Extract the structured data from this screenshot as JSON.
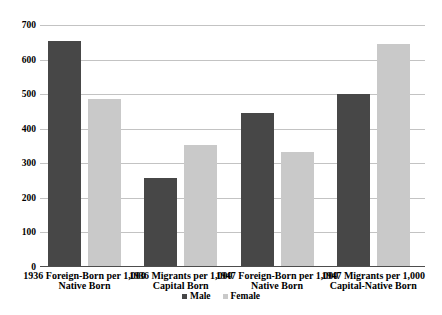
{
  "chart_data": {
    "type": "bar",
    "title": "",
    "xlabel": "",
    "ylabel": "",
    "categories": [
      "1936 Foreign-Born per 1,000\nNative Born",
      "1936 Migrants per 1,000\nCapital Born",
      "1947 Foreign-Born per 1,000\nNative Born",
      "1947 Migrants per 1,000\nCapital-Native Born"
    ],
    "series": [
      {
        "name": "Male",
        "color": "#474747",
        "values": [
          655,
          257,
          445,
          501
        ]
      },
      {
        "name": "Female",
        "color": "#c9c9c9",
        "values": [
          486,
          354,
          333,
          645
        ]
      }
    ],
    "ylim": [
      0,
      700
    ],
    "yticks": [
      0,
      100,
      200,
      300,
      400,
      500,
      600,
      700
    ],
    "grid": true,
    "legend_position": "bottom"
  },
  "colors": {
    "background": "#ffffff",
    "gridline": "#c3c3c3",
    "baseline": "#4d4d4d",
    "text": "#000000",
    "male_bar": "#474747",
    "female_bar": "#c9c9c9"
  }
}
